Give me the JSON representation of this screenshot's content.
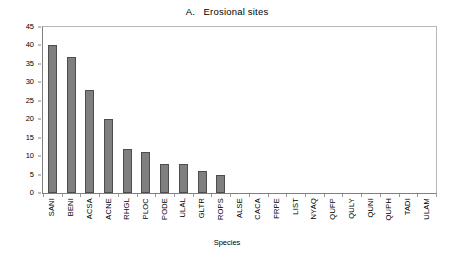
{
  "chart_data": {
    "type": "bar",
    "title": "A.   Erosional sites",
    "xlabel": "Species",
    "ylabel": "",
    "ylim": [
      0,
      45
    ],
    "ytick_step": 5,
    "yticks": [
      "0",
      "5",
      "10",
      "15",
      "20",
      "25",
      "30",
      "35",
      "40",
      "45"
    ],
    "grid": false,
    "legend": "none",
    "bar_color": "#7f7f7f",
    "bar_border_color": "#4d4d4d",
    "categories": [
      "SANI",
      "BENI",
      "ACSA",
      "ACNE",
      "RHGL",
      "PLOC",
      "PODE",
      "ULAL",
      "GLTR",
      "ROPS",
      "ALSE",
      "CACA",
      "FRPE",
      "LIST",
      "NYAQ",
      "QUFP",
      "QULY",
      "QUNI",
      "QUPH",
      "TADI",
      "ULAM"
    ],
    "values": [
      40,
      37,
      28,
      20,
      12,
      11,
      8,
      8,
      6,
      5,
      0,
      0,
      0,
      0,
      0,
      0,
      0,
      0,
      0,
      0,
      0
    ]
  }
}
